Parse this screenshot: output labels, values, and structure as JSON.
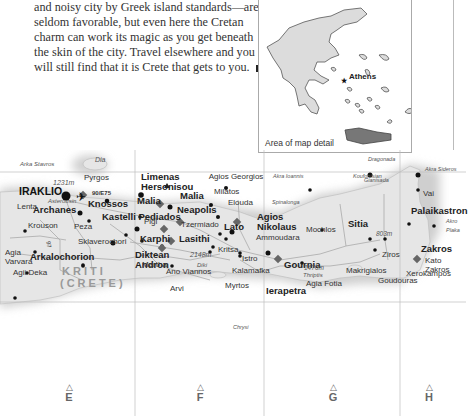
{
  "text": {
    "lines": [
      "and noisy city by Greek island standards—are",
      "seldom favorable, but even here the Cretan",
      "charm can work its magic as you get beneath",
      "the skin of the city. Travel elsewhere and you",
      "will still find that it is Crete that gets to you."
    ]
  },
  "inset": {
    "city": "Athens",
    "caption": "Area of map detail",
    "highlight_color": "#777777"
  },
  "map": {
    "colors": {
      "land": "#e6e6e6",
      "sea": "#ffffff",
      "road": "#aaaaaa",
      "grid": "#bdbdbd"
    },
    "road_label": "90/E75",
    "road_label_2": "97",
    "region": {
      "line1": "KRITI",
      "line2": "(CRETE)"
    },
    "capes": [
      "Arka Stavros",
      "Akra Ioannis",
      "Spinalonga",
      "Akra Sideros",
      "Akro Plaka"
    ],
    "islands": [
      "Dia",
      "Dragonada",
      "Gianisada",
      "Chrysi",
      "Koufonisian"
    ],
    "peaks": [
      {
        "elev": "2148m",
        "name": "Diki"
      },
      {
        "elev": "1476m",
        "name": "Thriptis"
      },
      {
        "elev": "803m",
        "name": ""
      },
      {
        "elev": "1231m",
        "name": "Asterousin"
      }
    ],
    "major_towns": [
      "IRAKLIO",
      "Limenas Hersonisou",
      "Malia",
      "Neapolis",
      "Agios Nikolaus",
      "Sitia",
      "Palaikastron",
      "Ierapetra",
      "Archanes",
      "Arkalochorion",
      "Kastelli Pediados"
    ],
    "sites": [
      "Knossos",
      "Malia",
      "Lasithi",
      "Karphi",
      "Diktean Andron",
      "Lato",
      "Gournia",
      "Zakros"
    ],
    "villages": [
      "Agios Georgios",
      "Milatos",
      "Elouda",
      "Tzermiado",
      "Ammoudara",
      "Kritsa",
      "Istro",
      "Mochlos",
      "Vai",
      "Krouson",
      "Peza",
      "Pigi",
      "Sklaverochori",
      "Agia Varvara",
      "Agii Deka",
      "Martha",
      "Ano Viannos",
      "Kalamafka",
      "Myrtos",
      "Arvi",
      "Pyrgos",
      "Lenta",
      "Ziros",
      "Kato Zakros",
      "Makrigialos",
      "Agia Fotia",
      "Xerokampos",
      "Goudouras"
    ],
    "grid_columns": [
      "E",
      "F",
      "G",
      "H"
    ]
  }
}
